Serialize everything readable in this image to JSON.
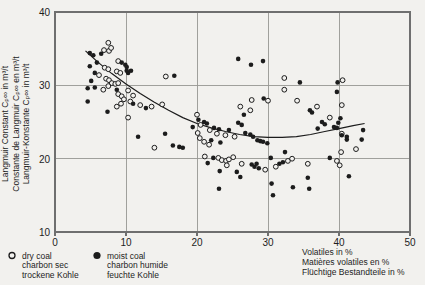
{
  "figure": {
    "background": "#f2f1ee",
    "ink": "#1c1c1c",
    "frame_color": "#6f6f6f",
    "grid_color": "#979792"
  },
  "chart_data": {
    "type": "scatter",
    "title": "",
    "xlabel_lines": [
      "Volatiles in %",
      "Matières volatiles en %",
      "Flüchtige Bestandteile in %"
    ],
    "ylabel_lines": [
      "Langmuir Constant Cₚ∞ in m³/t",
      "Constante de Langmuir Cₚ∞ en m³/t",
      "Langmuir-Konstante Cₚ∞ in m³/t"
    ],
    "xlim": [
      0,
      50
    ],
    "ylim": [
      10,
      40
    ],
    "x_ticks": [
      0,
      10,
      20,
      30,
      40,
      50
    ],
    "y_ticks": [
      40,
      30,
      20,
      10
    ],
    "grid": true,
    "legend_position": "bottom-left",
    "series": [
      {
        "name": "dry coal",
        "marker": "open-circle",
        "legend_labels": [
          "dry coal",
          "charbon sec",
          "trockene Kohle"
        ],
        "points": [
          [
            7.5,
            35.8
          ],
          [
            6.9,
            34.8
          ],
          [
            7.6,
            34.7
          ],
          [
            7.9,
            35.1
          ],
          [
            8.9,
            33.3
          ],
          [
            7.0,
            32.4
          ],
          [
            7.5,
            32.2
          ],
          [
            6.2,
            31.4
          ],
          [
            8.7,
            31.9
          ],
          [
            9.2,
            31.7
          ],
          [
            7.2,
            30.9
          ],
          [
            7.6,
            30.7
          ],
          [
            8.0,
            30.3
          ],
          [
            8.5,
            30.2
          ],
          [
            8.9,
            30.3
          ],
          [
            7.5,
            29.9
          ],
          [
            6.8,
            29.4
          ],
          [
            8.9,
            28.8
          ],
          [
            9.4,
            28.5
          ],
          [
            9.7,
            28.1
          ],
          [
            9.3,
            27.5
          ],
          [
            10.3,
            29.3
          ],
          [
            10.6,
            27.8
          ],
          [
            8.7,
            27.1
          ],
          [
            10.3,
            25.6
          ],
          [
            11.0,
            28.6
          ],
          [
            12.0,
            27.3
          ],
          [
            13.6,
            27.1
          ],
          [
            15.1,
            27.4
          ],
          [
            15.6,
            31.2
          ],
          [
            14.0,
            21.5
          ],
          [
            20.0,
            26.0
          ],
          [
            20.5,
            24.6
          ],
          [
            21.8,
            23.9
          ],
          [
            22.8,
            23.4
          ],
          [
            24.0,
            23.2
          ],
          [
            25.3,
            23.0
          ],
          [
            20.1,
            23.5
          ],
          [
            20.4,
            22.8
          ],
          [
            21.0,
            22.3
          ],
          [
            21.7,
            21.9
          ],
          [
            21.1,
            20.3
          ],
          [
            23.0,
            20.1
          ],
          [
            23.5,
            19.8
          ],
          [
            24.1,
            19.7
          ],
          [
            24.5,
            19.9
          ],
          [
            25.1,
            20.2
          ],
          [
            24.2,
            19.1
          ],
          [
            26.3,
            19.3
          ],
          [
            29.6,
            18.5
          ],
          [
            31.1,
            18.9
          ],
          [
            32.8,
            19.7
          ],
          [
            33.4,
            20.0
          ],
          [
            35.6,
            19.3
          ],
          [
            26.1,
            27.1
          ],
          [
            27.5,
            26.6
          ],
          [
            27.7,
            28.0
          ],
          [
            30.0,
            27.9
          ],
          [
            32.3,
            31.0
          ],
          [
            32.3,
            29.4
          ],
          [
            34.1,
            27.9
          ],
          [
            36.9,
            27.1
          ],
          [
            40.5,
            30.7
          ],
          [
            40.4,
            27.3
          ],
          [
            38.7,
            25.6
          ],
          [
            40.4,
            23.4
          ],
          [
            42.4,
            21.3
          ],
          [
            40.3,
            20.9
          ],
          [
            39.7,
            19.7
          ],
          [
            40.1,
            19.1
          ]
        ]
      },
      {
        "name": "moist coal",
        "marker": "filled-circle",
        "legend_labels": [
          "moist coal",
          "charbon humide",
          "feuchte Kohle"
        ],
        "points": [
          [
            4.9,
            34.4
          ],
          [
            5.4,
            34.1
          ],
          [
            6.5,
            34.3
          ],
          [
            5.9,
            33.1
          ],
          [
            5.6,
            31.7
          ],
          [
            5.1,
            30.6
          ],
          [
            4.6,
            29.6
          ],
          [
            5.6,
            29.7
          ],
          [
            8.7,
            29.4
          ],
          [
            9.4,
            33.1
          ],
          [
            9.9,
            32.8
          ],
          [
            10.1,
            32.5
          ],
          [
            10.1,
            32.0
          ],
          [
            10.3,
            31.7
          ],
          [
            10.7,
            32.0
          ],
          [
            4.9,
            32.6
          ],
          [
            4.6,
            27.8
          ],
          [
            7.4,
            26.4
          ],
          [
            11.0,
            27.5
          ],
          [
            12.8,
            26.9
          ],
          [
            16.8,
            31.3
          ],
          [
            11.7,
            23.0
          ],
          [
            15.5,
            23.4
          ],
          [
            16.6,
            21.8
          ],
          [
            17.5,
            21.6
          ],
          [
            18.0,
            21.5
          ],
          [
            19.4,
            24.3
          ],
          [
            20.2,
            25.3
          ],
          [
            21.0,
            25.0
          ],
          [
            21.4,
            24.8
          ],
          [
            22.4,
            24.2
          ],
          [
            23.1,
            24.0
          ],
          [
            24.5,
            23.9
          ],
          [
            25.8,
            24.9
          ],
          [
            26.3,
            24.6
          ],
          [
            26.8,
            23.5
          ],
          [
            27.5,
            23.3
          ],
          [
            27.9,
            23.0
          ],
          [
            28.5,
            22.5
          ],
          [
            28.9,
            22.4
          ],
          [
            29.3,
            22.3
          ],
          [
            29.9,
            22.1
          ],
          [
            26.6,
            26.0
          ],
          [
            22.0,
            22.5
          ],
          [
            23.3,
            22.2
          ],
          [
            22.3,
            20.1
          ],
          [
            21.5,
            19.4
          ],
          [
            25.6,
            18.2
          ],
          [
            23.2,
            18.3
          ],
          [
            27.7,
            19.2
          ],
          [
            28.1,
            18.9
          ],
          [
            28.4,
            19.3
          ],
          [
            28.7,
            18.7
          ],
          [
            30.4,
            20.1
          ],
          [
            31.6,
            19.3
          ],
          [
            32.1,
            19.5
          ],
          [
            32.4,
            20.9
          ],
          [
            23.1,
            15.9
          ],
          [
            26.1,
            17.5
          ],
          [
            30.5,
            16.6
          ],
          [
            30.7,
            15.0
          ],
          [
            33.5,
            16.1
          ],
          [
            35.6,
            17.4
          ],
          [
            35.8,
            15.9
          ],
          [
            38.7,
            20.1
          ],
          [
            41.4,
            17.6
          ],
          [
            25.8,
            33.6
          ],
          [
            27.6,
            32.8
          ],
          [
            29.3,
            33.3
          ],
          [
            34.5,
            30.4
          ],
          [
            29.4,
            28.2
          ],
          [
            35.9,
            26.6
          ],
          [
            36.2,
            26.3
          ],
          [
            37.0,
            24.1
          ],
          [
            37.6,
            25.0
          ],
          [
            38.0,
            24.7
          ],
          [
            39.3,
            24.3
          ],
          [
            39.7,
            24.2
          ],
          [
            39.9,
            24.9
          ],
          [
            40.4,
            23.2
          ],
          [
            41.1,
            22.6
          ],
          [
            40.2,
            25.5
          ],
          [
            39.8,
            30.4
          ],
          [
            39.7,
            29.1
          ],
          [
            43.2,
            22.6
          ],
          [
            43.4,
            23.9
          ],
          [
            41.1,
            23.0
          ]
        ]
      }
    ],
    "trend_line": {
      "points": [
        [
          4.3,
          34.7
        ],
        [
          6,
          33.2
        ],
        [
          8,
          31.6
        ],
        [
          10,
          30.2
        ],
        [
          12,
          28.9
        ],
        [
          14,
          27.7
        ],
        [
          16,
          26.6
        ],
        [
          18,
          25.6
        ],
        [
          20,
          24.8
        ],
        [
          22,
          24.2
        ],
        [
          24,
          23.7
        ],
        [
          26,
          23.3
        ],
        [
          28,
          23.0
        ],
        [
          30,
          22.9
        ],
        [
          32,
          22.9
        ],
        [
          34,
          23.0
        ],
        [
          36,
          23.3
        ],
        [
          38,
          23.7
        ],
        [
          40,
          24.1
        ],
        [
          42,
          24.5
        ],
        [
          43.6,
          24.8
        ]
      ]
    }
  }
}
